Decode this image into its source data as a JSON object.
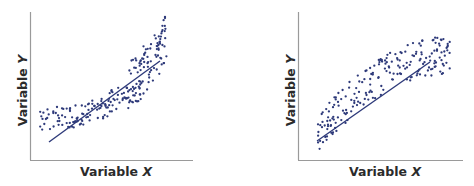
{
  "chart_data": [
    {
      "type": "scatter",
      "title": "",
      "xlabel": "Variable X",
      "ylabel": "Variable Y",
      "xlabel_prefix": "Variable",
      "xlabel_var": "X",
      "ylabel_prefix": "Variable",
      "ylabel_var": "Y",
      "grid": false,
      "legend": "none",
      "ticks": false,
      "pattern": "convex / upward-curving (U-shaped) nonlinear relationship with linear fit line",
      "point_color": "#2e3a7a",
      "line_color": "#2e3a7a",
      "axis_color": "#9a9a9a",
      "trend_line": {
        "x": [
          0.11,
          0.8
        ],
        "y": [
          0.12,
          0.68
        ]
      },
      "xlim": [
        0,
        1
      ],
      "ylim": [
        0,
        1
      ],
      "cluster_description": [
        {
          "region": "left lobe",
          "x_range": [
            0.05,
            0.25
          ],
          "y_range": [
            0.2,
            0.4
          ]
        },
        {
          "region": "middle band",
          "x_range": [
            0.25,
            0.6
          ],
          "y_range": [
            0.18,
            0.5
          ]
        },
        {
          "region": "upper right lobe",
          "x_range": [
            0.6,
            0.83
          ],
          "y_range": [
            0.4,
            0.9
          ]
        }
      ]
    },
    {
      "type": "scatter",
      "title": "",
      "xlabel": "Variable X",
      "ylabel": "Variable Y",
      "xlabel_prefix": "Variable",
      "xlabel_var": "X",
      "ylabel_prefix": "Variable",
      "ylabel_var": "Y",
      "grid": false,
      "legend": "none",
      "ticks": false,
      "pattern": "concave / downward-curving nonlinear relationship with linear fit line",
      "point_color": "#2e3a7a",
      "line_color": "#2e3a7a",
      "axis_color": "#9a9a9a",
      "trend_line": {
        "x": [
          0.12,
          0.8
        ],
        "y": [
          0.13,
          0.66
        ]
      },
      "xlim": [
        0,
        1
      ],
      "ylim": [
        0,
        1
      ],
      "cluster_description": [
        {
          "region": "lower left",
          "x_range": [
            0.12,
            0.3
          ],
          "y_range": [
            0.02,
            0.45
          ]
        },
        {
          "region": "middle rise",
          "x_range": [
            0.3,
            0.6
          ],
          "y_range": [
            0.3,
            0.7
          ]
        },
        {
          "region": "upper right plateau",
          "x_range": [
            0.6,
            0.9
          ],
          "y_range": [
            0.45,
            0.72
          ]
        }
      ]
    }
  ]
}
